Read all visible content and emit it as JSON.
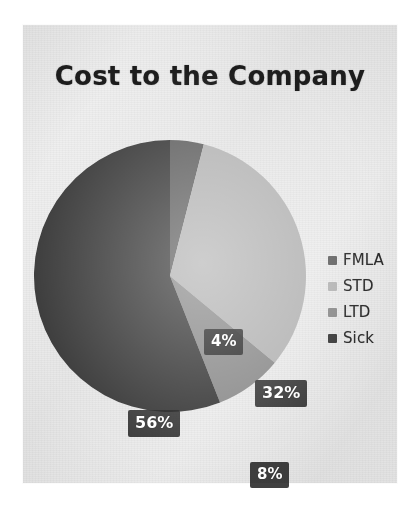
{
  "chart_data": {
    "type": "pie",
    "title": "Cost to the Company",
    "categories": [
      "FMLA",
      "STD",
      "LTD",
      "Sick"
    ],
    "values": [
      4,
      32,
      8,
      56
    ],
    "value_unit": "%",
    "data_labels": [
      "4%",
      "32%",
      "8%",
      "56%"
    ],
    "colors": [
      "#636363",
      "#b4b4b4",
      "#8c8c8c",
      "#3a3a3a"
    ],
    "legend_position": "right",
    "grid": false,
    "xlabel": "",
    "ylabel": "",
    "start_angle_deg": 0,
    "direction": "clockwise"
  },
  "chart": {
    "title": "Cost to the Company",
    "slices": [
      {
        "name": "FMLA",
        "label": "4%",
        "value": 4,
        "color": "#636363"
      },
      {
        "name": "STD",
        "label": "32%",
        "value": 32,
        "color": "#b4b4b4"
      },
      {
        "name": "LTD",
        "label": "8%",
        "value": 8,
        "color": "#8c8c8c"
      },
      {
        "name": "Sick",
        "label": "56%",
        "value": 56,
        "color": "#3a3a3a"
      }
    ]
  },
  "legend": {
    "items": [
      {
        "label": "FMLA",
        "color": "#636363"
      },
      {
        "label": "STD",
        "color": "#b4b4b4"
      },
      {
        "label": "LTD",
        "color": "#8c8c8c"
      },
      {
        "label": "Sick",
        "color": "#3a3a3a"
      }
    ]
  },
  "colors": {
    "paper_background": "#eaeaea",
    "page_background": "#ffffff",
    "title_text": "#1d1d1d",
    "label_text": "#ffffff",
    "label_background": "#222222"
  }
}
